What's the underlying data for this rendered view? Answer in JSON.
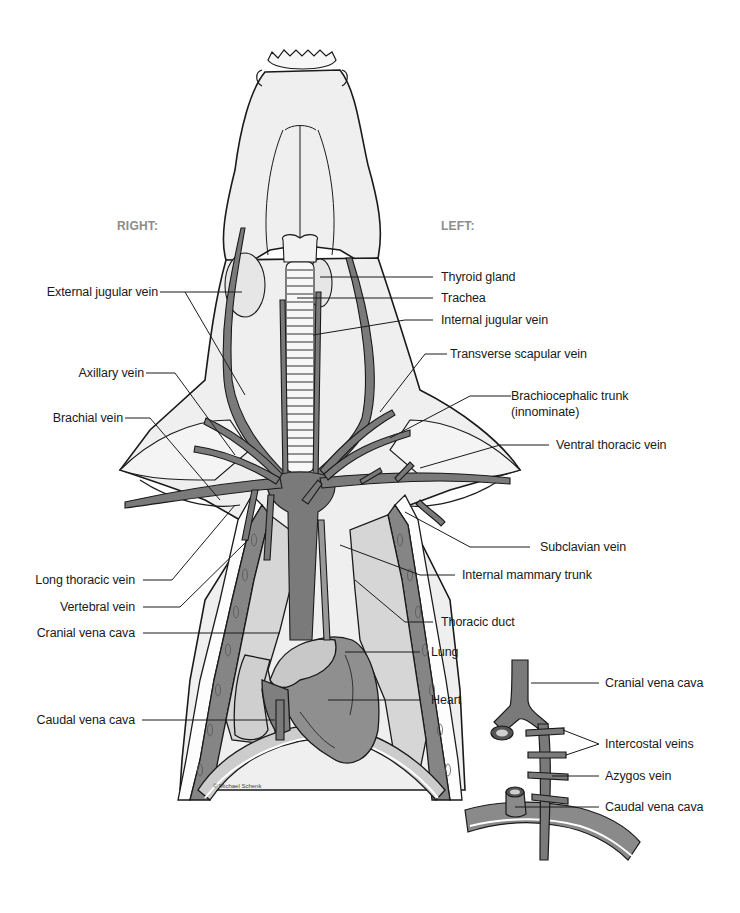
{
  "figure": {
    "orientation": {
      "right": "RIGHT:",
      "left": "LEFT:"
    },
    "credit": "© Michael Schenk",
    "colors": {
      "vein": "#7a7a7a",
      "tissue": "#ececec",
      "lung": "#d4d4d4",
      "heart": "#8f8f8f",
      "outline": "#1a1a1a",
      "side_label": "#8c8c8c"
    }
  },
  "labels_left": [
    {
      "id": "external-jugular-vein",
      "text": "External jugular vein"
    },
    {
      "id": "axillary-vein",
      "text": "Axillary vein"
    },
    {
      "id": "brachial-vein",
      "text": "Brachial vein"
    },
    {
      "id": "long-thoracic-vein",
      "text": "Long thoracic vein"
    },
    {
      "id": "vertebral-vein",
      "text": "Vertebral vein"
    },
    {
      "id": "cranial-vena-cava",
      "text": "Cranial vena cava"
    },
    {
      "id": "caudal-vena-cava",
      "text": "Caudal vena cava"
    }
  ],
  "labels_right": [
    {
      "id": "thyroid-gland",
      "text": "Thyroid gland"
    },
    {
      "id": "trachea",
      "text": "Trachea"
    },
    {
      "id": "internal-jugular-vein",
      "text": "Internal jugular vein"
    },
    {
      "id": "transverse-scapular-vein",
      "text": "Transverse scapular vein"
    },
    {
      "id": "brachiocephalic-trunk",
      "text": "Brachiocephalic trunk",
      "text2": "(innominate)"
    },
    {
      "id": "ventral-thoracic-vein",
      "text": "Ventral thoracic vein"
    },
    {
      "id": "subclavian-vein",
      "text": "Subclavian vein"
    },
    {
      "id": "internal-mammary-trunk",
      "text": "Internal mammary trunk"
    },
    {
      "id": "thoracic-duct",
      "text": "Thoracic duct"
    },
    {
      "id": "lung",
      "text": "Lung"
    },
    {
      "id": "heart",
      "text": "Heart"
    }
  ],
  "inset": {
    "description": "Azygos vein detail",
    "labels": [
      {
        "id": "inset-cranial-vena-cava",
        "text": "Cranial vena cava"
      },
      {
        "id": "intercostal-veins",
        "text": "Intercostal veins"
      },
      {
        "id": "azygos-vein",
        "text": "Azygos vein"
      },
      {
        "id": "inset-caudal-vena-cava",
        "text": "Caudal vena cava"
      }
    ]
  }
}
